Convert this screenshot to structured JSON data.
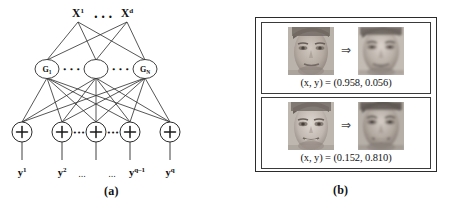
{
  "figure": {
    "panels": [
      {
        "id": "a",
        "sublabel": "(a)",
        "type": "neural-network-diagram",
        "layers": {
          "input": {
            "labels": [
              "X¹",
              "Xᵈ"
            ],
            "ellipsis": "• • •"
          },
          "hidden": {
            "labels": [
              "G₁",
              "",
              "Gₙ"
            ],
            "node_count": 3,
            "ellipsis_left": "• • •",
            "ellipsis_right": "• • •"
          },
          "output": {
            "node_symbol": "+",
            "node_count": 5,
            "ellipsis_left": "•••",
            "ellipsis_right": "•••",
            "labels": [
              "y¹",
              "y²",
              "…",
              "…",
              "yᵠ⁻¹",
              "yᵠ"
            ],
            "label_y1": "y¹",
            "label_y2": "y²",
            "label_ellipsis_left": "...",
            "label_ellipsis_right": "...",
            "label_yqm1": "y",
            "label_yqm1_sup": "q–1",
            "label_yq": "y",
            "label_yq_sup": "q"
          }
        }
      },
      {
        "id": "b",
        "sublabel": "(b)",
        "type": "face-image-examples",
        "examples": [
          {
            "arrow": "⇒",
            "caption_prefix": "(x, y) = ",
            "caption_values": "(0.958, 0.056)",
            "caption_full": "(x, y) = (0.958, 0.056)",
            "x": 0.958,
            "y": 0.056,
            "source_image": "face-input-1",
            "target_image": "face-output-1"
          },
          {
            "arrow": "⇒",
            "caption_prefix": "(x, y) = ",
            "caption_values": "(0.152, 0.810)",
            "caption_full": "(x, y) = (0.152, 0.810)",
            "x": 0.152,
            "y": 0.81,
            "source_image": "face-input-2",
            "target_image": "face-output-2"
          }
        ]
      }
    ]
  },
  "colors": {
    "ink": "#1a1a1a",
    "stroke": "#2b2b2b",
    "panel_border": "#3a3a3a",
    "background": "#ffffff"
  }
}
